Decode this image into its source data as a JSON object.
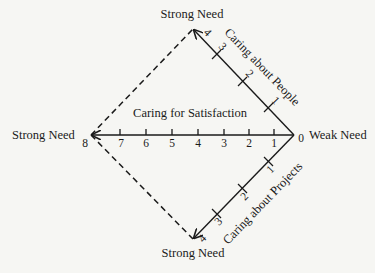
{
  "diagram": {
    "title_top": "Strong Need",
    "title_bottom": "Strong Need",
    "title_left": "Strong Need",
    "title_right": "Weak Need",
    "axes": {
      "satisfaction": {
        "label": "Caring for Satisfaction",
        "ticks": [
          "8",
          "7",
          "6",
          "5",
          "4",
          "3",
          "2",
          "1",
          "0"
        ]
      },
      "people": {
        "label": "Caring about People",
        "ticks": [
          "4",
          "3",
          "2",
          "1"
        ]
      },
      "projects": {
        "label": "Caring about Projects",
        "ticks": [
          "1",
          "2",
          "3",
          "4"
        ]
      }
    },
    "colors": {
      "background": "#f6f6f3",
      "ink": "#1a1a1a"
    }
  }
}
